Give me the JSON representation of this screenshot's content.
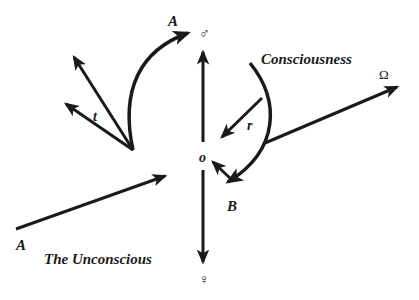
{
  "diagram": {
    "labels": {
      "A_top": "A",
      "male_symbol": "♂",
      "consciousness": "Consciousness",
      "omega": "Ω",
      "t": "t",
      "r": "r",
      "o": "o",
      "B": "B",
      "A_bottom": "A",
      "unconscious": "The Unconscious",
      "female_symbol": "♀"
    },
    "colors": {
      "ink": "#1a1a1a",
      "background": "#ffffff"
    }
  }
}
